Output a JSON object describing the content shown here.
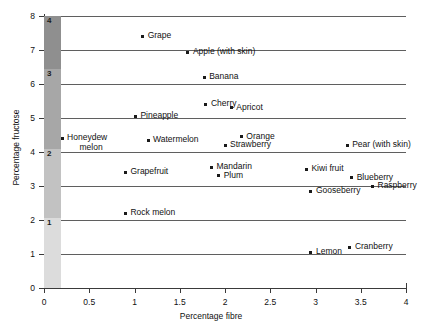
{
  "chart_data": {
    "type": "scatter",
    "title": "",
    "xlabel": "Percentage fibre",
    "ylabel": "Percentage fructose",
    "xlim": [
      0,
      4
    ],
    "ylim": [
      0,
      8
    ],
    "xticks": [
      "0",
      "0.5",
      "1",
      "1.5",
      "2",
      "2.5",
      "3",
      "3.5",
      "4"
    ],
    "yticks": [
      "0",
      "1",
      "2",
      "3",
      "4",
      "5",
      "6",
      "7",
      "8"
    ],
    "xtick_values": [
      0,
      0.5,
      1,
      1.5,
      2,
      2.5,
      3,
      3.5,
      4
    ],
    "ytick_values": [
      0,
      1,
      2,
      3,
      4,
      5,
      6,
      7,
      8
    ],
    "grid": "horizontal-only",
    "legend": "none",
    "points": [
      {
        "label": "Grape",
        "x": 1.09,
        "y": 7.4
      },
      {
        "label": "Apple (with skin)",
        "x": 1.59,
        "y": 6.94
      },
      {
        "label": "Banana",
        "x": 1.77,
        "y": 6.2
      },
      {
        "label": "Cherry",
        "x": 1.79,
        "y": 5.4
      },
      {
        "label": "Apricot",
        "x": 2.07,
        "y": 5.3
      },
      {
        "label": "Pineapple",
        "x": 1.01,
        "y": 5.05
      },
      {
        "label": "Orange",
        "x": 2.18,
        "y": 4.45
      },
      {
        "label": "Honeydew melon",
        "x": 0.2,
        "y": 4.4,
        "wrap": true
      },
      {
        "label": "Watermelon",
        "x": 1.15,
        "y": 4.35
      },
      {
        "label": "Strawberry",
        "x": 2.0,
        "y": 4.2
      },
      {
        "label": "Pear (with skin)",
        "x": 3.35,
        "y": 4.2
      },
      {
        "label": "Mandarin",
        "x": 1.85,
        "y": 3.55
      },
      {
        "label": "Kiwi fruit",
        "x": 2.9,
        "y": 3.5
      },
      {
        "label": "Grapefruit",
        "x": 0.9,
        "y": 3.4
      },
      {
        "label": "Plum",
        "x": 1.93,
        "y": 3.3
      },
      {
        "label": "Blueberry",
        "x": 3.4,
        "y": 3.25
      },
      {
        "label": "Raspberry",
        "x": 3.63,
        "y": 3.0
      },
      {
        "label": "Gooseberry",
        "x": 2.95,
        "y": 2.85
      },
      {
        "label": "Rock melon",
        "x": 0.9,
        "y": 2.2
      },
      {
        "label": "Cranberry",
        "x": 3.38,
        "y": 1.2
      },
      {
        "label": "Lemon",
        "x": 2.95,
        "y": 1.05
      }
    ],
    "fructose_band": {
      "description": "Vertical grey shaded band at the left edge of the plot, divided into four graded segments labelled 4 (darkest, top) to 1 (lightest, bottom).",
      "segments": [
        {
          "label": "4",
          "y_from": 6.45,
          "y_to": 8.0,
          "color": "#8f8f8f"
        },
        {
          "label": "3",
          "y_from": 4.1,
          "y_to": 6.45,
          "color": "#a7a7a7"
        },
        {
          "label": "2",
          "y_from": 2.05,
          "y_to": 4.1,
          "color": "#c2c2c2"
        },
        {
          "label": "1",
          "y_from": 0.0,
          "y_to": 2.05,
          "color": "#dcdcdc"
        }
      ]
    },
    "colors": {
      "marker": "#1a1a1a",
      "gridline": "#5f5f5f",
      "axis": "#3a3a3a",
      "background": "#ffffff",
      "text": "#111111"
    }
  }
}
